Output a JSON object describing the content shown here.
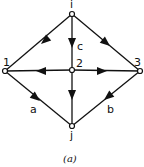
{
  "diagram": {
    "caption": "(a)",
    "nodes": [
      {
        "id": "i",
        "label": "i",
        "x": 72,
        "y": 14
      },
      {
        "id": "1",
        "label": "1",
        "x": 5,
        "y": 71
      },
      {
        "id": "2",
        "label": "2",
        "x": 72,
        "y": 70
      },
      {
        "id": "3",
        "label": "3",
        "x": 140,
        "y": 71
      },
      {
        "id": "j",
        "label": "j",
        "x": 72,
        "y": 126
      }
    ],
    "edges": [
      {
        "from": "i",
        "to": "1",
        "label": ""
      },
      {
        "from": "i",
        "to": "2",
        "label": "c"
      },
      {
        "from": "i",
        "to": "3",
        "label": ""
      },
      {
        "from": "2",
        "to": "1",
        "label": ""
      },
      {
        "from": "2",
        "to": "3",
        "label": ""
      },
      {
        "from": "2",
        "to": "j",
        "label": ""
      },
      {
        "from": "1",
        "to": "j",
        "label": "a"
      },
      {
        "from": "3",
        "to": "j",
        "label": "b"
      }
    ],
    "colors": {
      "line": "#111111",
      "background": "#ffffff"
    }
  }
}
